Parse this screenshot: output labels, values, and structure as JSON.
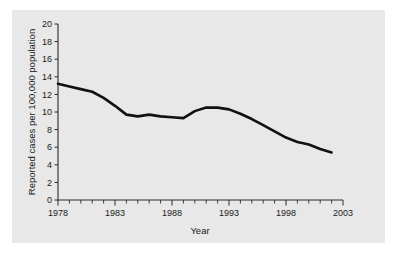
{
  "chart_data": {
    "type": "line",
    "title": "",
    "xlabel": "Year",
    "ylabel": "Reported cases per 100,000 population",
    "xlim": [
      1978,
      2003
    ],
    "ylim": [
      0,
      20
    ],
    "grid": false,
    "legend": false,
    "xticks": [
      1978,
      1983,
      1988,
      1993,
      1998,
      2003
    ],
    "xtick_labels": [
      "1978",
      "1983",
      "1988",
      "1993",
      "1998",
      "2003"
    ],
    "xminor_tick_interval": 1,
    "yticks": [
      0,
      2,
      4,
      6,
      8,
      10,
      12,
      14,
      16,
      18,
      20
    ],
    "ytick_labels": [
      "0",
      "2",
      "4",
      "6",
      "8",
      "10",
      "12",
      "14",
      "16",
      "18",
      "20"
    ],
    "line_color": "#111111",
    "panel_color": "#e8e8e8",
    "series": [
      {
        "name": "Reported cases per 100,000 population",
        "x": [
          1978,
          1979,
          1980,
          1981,
          1982,
          1983,
          1984,
          1985,
          1986,
          1987,
          1988,
          1989,
          1990,
          1991,
          1992,
          1993,
          1994,
          1995,
          1996,
          1997,
          1998,
          1999,
          2000,
          2001,
          2002
        ],
        "values": [
          13.2,
          12.9,
          12.6,
          12.3,
          11.6,
          10.7,
          9.7,
          9.5,
          9.7,
          9.5,
          9.4,
          9.3,
          10.1,
          10.5,
          10.5,
          10.3,
          9.8,
          9.2,
          8.5,
          7.8,
          7.1,
          6.6,
          6.3,
          5.8,
          5.4
        ]
      }
    ]
  },
  "axis": {
    "x_title": "Year",
    "y_title": "Reported cases per 100,000 population"
  }
}
